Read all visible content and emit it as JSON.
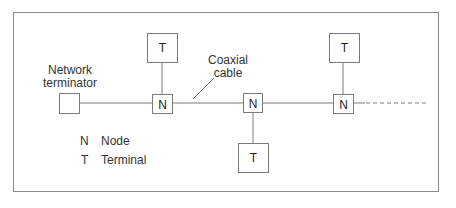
{
  "diagram": {
    "labels": {
      "network_terminator": [
        "Network",
        "terminator"
      ],
      "coaxial_cable": [
        "Coaxial",
        "cable"
      ]
    },
    "nodes": [
      {
        "id": "n1",
        "label": "N"
      },
      {
        "id": "n2",
        "label": "N"
      },
      {
        "id": "n3",
        "label": "N"
      }
    ],
    "terminals": [
      {
        "id": "t1",
        "label": "T",
        "attached_to": "n1",
        "position": "above"
      },
      {
        "id": "t2",
        "label": "T",
        "attached_to": "n2",
        "position": "below"
      },
      {
        "id": "t3",
        "label": "T",
        "attached_to": "n3",
        "position": "above"
      }
    ],
    "legend": [
      {
        "symbol": "N",
        "meaning": "Node"
      },
      {
        "symbol": "T",
        "meaning": "Terminal"
      }
    ],
    "colors": {
      "stroke": "#7a7a7a",
      "text": "#2a2a2a",
      "frame": "#8a8a8a"
    }
  }
}
